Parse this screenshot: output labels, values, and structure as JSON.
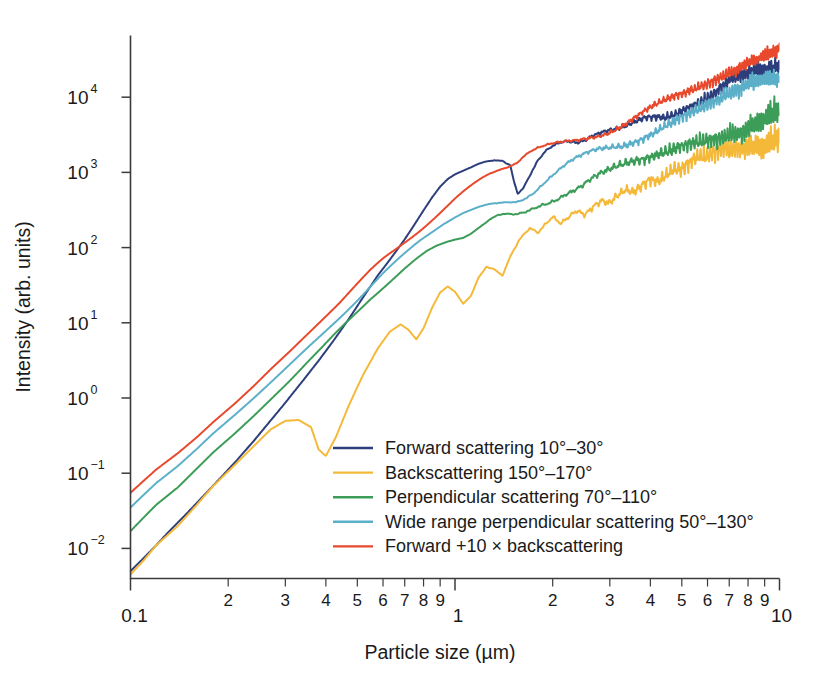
{
  "chart_data": {
    "type": "line",
    "title": "",
    "xlabel": "Particle size (µm)",
    "ylabel": "Intensity (arb. units)",
    "xscale": "log",
    "yscale": "log",
    "xlim": [
      0.1,
      10
    ],
    "ylim": [
      0.003,
      70000
    ],
    "grid": false,
    "legend_position": "inside-lower-right",
    "x_tick_labels_major": [
      "0.1",
      "1",
      "10"
    ],
    "x_tick_labels_minor": [
      "2",
      "3",
      "4",
      "5",
      "6",
      "7",
      "8",
      "9"
    ],
    "y_tick_labels": [
      "10⁻²",
      "10⁻¹",
      "10⁰",
      "10¹",
      "10²",
      "10³",
      "10⁴"
    ],
    "y_tick_bases": [
      "10",
      "10",
      "10",
      "10",
      "10",
      "10",
      "10"
    ],
    "y_tick_exponents": [
      "-2",
      "-1",
      "0",
      "1",
      "2",
      "3",
      "4"
    ],
    "y_tick_values": [
      0.01,
      0.1,
      1,
      10,
      100,
      1000,
      10000
    ],
    "series": [
      {
        "name": "Forward scattering 10°–30°",
        "color": "#2C3E7C",
        "legend_label": "Forward scattering 10°–30°",
        "x": [
          0.1,
          0.11,
          0.12,
          0.13,
          0.15,
          0.17,
          0.19,
          0.21,
          0.24,
          0.27,
          0.3,
          0.34,
          0.38,
          0.42,
          0.47,
          0.52,
          0.58,
          0.62,
          0.66,
          0.7,
          0.75,
          0.8,
          0.85,
          0.9,
          0.95,
          1.0,
          1.06,
          1.12,
          1.18,
          1.25,
          1.32,
          1.4,
          1.48,
          1.52,
          1.56,
          1.62,
          1.7,
          1.8,
          1.9,
          2.0,
          2.12,
          2.24,
          2.37,
          2.51,
          2.66,
          2.82,
          2.98,
          3.16,
          3.35,
          3.55,
          3.76,
          3.98,
          4.22,
          4.47,
          4.73,
          5.01,
          5.31,
          5.62,
          5.96,
          6.31,
          6.68,
          7.08,
          7.5,
          7.94,
          8.41,
          8.91,
          9.44,
          10.0
        ],
        "y": [
          0.005,
          0.0075,
          0.011,
          0.016,
          0.03,
          0.053,
          0.088,
          0.14,
          0.27,
          0.5,
          0.86,
          1.7,
          3.2,
          5.8,
          11.5,
          22,
          44,
          64,
          92,
          130,
          200,
          300,
          430,
          580,
          720,
          830,
          950,
          1100,
          1300,
          1500,
          1650,
          1700,
          1500,
          900,
          620,
          700,
          1000,
          1500,
          1900,
          2150,
          2350,
          2400,
          2300,
          2500,
          2900,
          3200,
          3400,
          3500,
          3800,
          4300,
          4900,
          5400,
          5700,
          6000,
          6800,
          7900,
          9000,
          9800,
          10500,
          11500,
          13500,
          15500,
          17000,
          18000,
          19500,
          21000,
          22500,
          24000
        ]
      },
      {
        "name": "Backscattering 150°–170°",
        "color": "#F5B93A",
        "legend_label": "Backscattering 150°–170°",
        "x": [
          0.1,
          0.11,
          0.12,
          0.14,
          0.16,
          0.18,
          0.21,
          0.24,
          0.27,
          0.3,
          0.33,
          0.36,
          0.38,
          0.4,
          0.43,
          0.47,
          0.52,
          0.58,
          0.63,
          0.68,
          0.72,
          0.76,
          0.8,
          0.85,
          0.9,
          0.95,
          1.0,
          1.06,
          1.12,
          1.18,
          1.25,
          1.32,
          1.4,
          1.48,
          1.58,
          1.7,
          1.8,
          1.9,
          2.0,
          2.12,
          2.24,
          2.37,
          2.51,
          2.66,
          2.82,
          2.98,
          3.16,
          3.35,
          3.55,
          3.76,
          3.98,
          4.22,
          4.47,
          4.73,
          5.01,
          5.31,
          5.62,
          5.96,
          6.31,
          6.68,
          7.08,
          7.5,
          7.94,
          8.41,
          8.91,
          9.44,
          10.0
        ],
        "y": [
          0.0045,
          0.007,
          0.011,
          0.02,
          0.038,
          0.068,
          0.13,
          0.23,
          0.38,
          0.5,
          0.52,
          0.42,
          0.21,
          0.17,
          0.3,
          0.75,
          1.9,
          4.5,
          7.5,
          9.5,
          8.0,
          6.0,
          8.5,
          16,
          26,
          32,
          28,
          20,
          26,
          45,
          62,
          55,
          42,
          70,
          110,
          150,
          130,
          175,
          230,
          200,
          260,
          330,
          300,
          380,
          460,
          420,
          520,
          620,
          580,
          700,
          850,
          800,
          950,
          1100,
          1050,
          1250,
          1400,
          1350,
          1600,
          1850,
          1800,
          2100,
          2400,
          2350,
          2700,
          3000,
          3300
        ]
      },
      {
        "name": "Perpendicular scattering 70°–110°",
        "color": "#3C9D58",
        "legend_label": "Perpendicular scattering 70°–110°",
        "x": [
          0.1,
          0.11,
          0.12,
          0.14,
          0.16,
          0.18,
          0.21,
          0.24,
          0.27,
          0.31,
          0.35,
          0.39,
          0.44,
          0.49,
          0.55,
          0.6,
          0.65,
          0.7,
          0.76,
          0.82,
          0.88,
          0.95,
          1.0,
          1.06,
          1.12,
          1.2,
          1.28,
          1.36,
          1.45,
          1.55,
          1.65,
          1.75,
          1.85,
          1.95,
          2.05,
          2.18,
          2.31,
          2.45,
          2.6,
          2.75,
          2.92,
          3.09,
          3.28,
          3.47,
          3.68,
          3.9,
          4.14,
          4.38,
          4.65,
          4.92,
          5.22,
          5.53,
          5.86,
          6.21,
          6.59,
          6.98,
          7.4,
          7.85,
          8.32,
          8.82,
          9.35,
          10.0
        ],
        "y": [
          0.017,
          0.026,
          0.038,
          0.065,
          0.115,
          0.19,
          0.34,
          0.58,
          0.95,
          1.7,
          2.9,
          4.6,
          8.0,
          13,
          22,
          31,
          42,
          55,
          72,
          90,
          105,
          118,
          125,
          130,
          145,
          175,
          210,
          240,
          250,
          260,
          300,
          360,
          420,
          470,
          520,
          600,
          650,
          700,
          800,
          880,
          950,
          1050,
          1150,
          1250,
          1350,
          1450,
          1600,
          1750,
          1900,
          2100,
          2300,
          2500,
          2750,
          3000,
          3300,
          3600,
          3900,
          4200,
          4600,
          5000,
          5400,
          6000
        ]
      },
      {
        "name": "Wide range perpendicular scattering 50°–130°",
        "color": "#5CAFC9",
        "legend_label": "Wide range perpendicular scattering 50°–130°",
        "x": [
          0.1,
          0.11,
          0.12,
          0.14,
          0.16,
          0.18,
          0.21,
          0.24,
          0.27,
          0.31,
          0.35,
          0.39,
          0.44,
          0.49,
          0.55,
          0.6,
          0.66,
          0.72,
          0.78,
          0.85,
          0.92,
          1.0,
          1.06,
          1.12,
          1.2,
          1.28,
          1.36,
          1.45,
          1.55,
          1.65,
          1.75,
          1.85,
          1.95,
          2.06,
          2.18,
          2.31,
          2.45,
          2.6,
          2.75,
          2.92,
          3.09,
          3.28,
          3.47,
          3.68,
          3.9,
          4.14,
          4.38,
          4.65,
          4.92,
          5.22,
          5.53,
          5.86,
          6.21,
          6.59,
          6.98,
          7.4,
          7.85,
          8.32,
          8.82,
          9.35,
          10.0
        ],
        "y": [
          0.035,
          0.052,
          0.074,
          0.125,
          0.21,
          0.34,
          0.6,
          1.0,
          1.6,
          2.8,
          4.6,
          7.2,
          12,
          19,
          31,
          44,
          62,
          85,
          115,
          155,
          205,
          260,
          300,
          330,
          370,
          400,
          420,
          440,
          450,
          500,
          580,
          700,
          820,
          950,
          1100,
          1250,
          1400,
          1600,
          1800,
          2000,
          2200,
          2400,
          2700,
          3000,
          3400,
          3800,
          4300,
          4800,
          5400,
          6000,
          6800,
          7600,
          8500,
          9500,
          10500,
          11500,
          12500,
          13500,
          14500,
          15500,
          16500
        ]
      },
      {
        "name": "Forward +10 × backscattering",
        "color": "#E8492C",
        "legend_label": "Forward +10 × backscattering",
        "x": [
          0.1,
          0.11,
          0.12,
          0.14,
          0.16,
          0.18,
          0.21,
          0.24,
          0.27,
          0.31,
          0.35,
          0.39,
          0.44,
          0.49,
          0.55,
          0.6,
          0.66,
          0.72,
          0.78,
          0.85,
          0.92,
          1.0,
          1.06,
          1.12,
          1.2,
          1.28,
          1.36,
          1.45,
          1.55,
          1.62,
          1.7,
          1.8,
          1.9,
          2.0,
          2.12,
          2.24,
          2.37,
          2.51,
          2.66,
          2.82,
          2.98,
          3.16,
          3.35,
          3.55,
          3.76,
          3.98,
          4.22,
          4.47,
          4.73,
          5.01,
          5.31,
          5.62,
          5.96,
          6.31,
          6.68,
          7.08,
          7.5,
          7.94,
          8.41,
          8.91,
          9.44,
          10.0
        ],
        "y": [
          0.055,
          0.08,
          0.112,
          0.185,
          0.3,
          0.48,
          0.85,
          1.45,
          2.4,
          4.2,
          7.0,
          11,
          18,
          29,
          48,
          68,
          96,
          135,
          185,
          260,
          350,
          470,
          560,
          650,
          780,
          900,
          1000,
          1100,
          1250,
          1500,
          1750,
          1950,
          2100,
          2250,
          2400,
          2600,
          2800,
          3100,
          3400,
          3700,
          4000,
          4400,
          4800,
          5300,
          5900,
          6500,
          7200,
          8000,
          9000,
          10000,
          11500,
          13000,
          15000,
          17000,
          19000,
          22000,
          25000,
          29000,
          33000,
          38000,
          44000,
          52000
        ]
      }
    ]
  },
  "axes": {
    "y_axis_title": "Intensity (arb. units)",
    "x_axis_title": "Particle size (µm)",
    "x_major_ticks": [
      {
        "label": "0.1",
        "value": 0.1
      },
      {
        "label": "1",
        "value": 1
      },
      {
        "label": "10",
        "value": 10
      }
    ],
    "x_minor_ticks": [
      {
        "label": "2",
        "value": 0.2
      },
      {
        "label": "3",
        "value": 0.3
      },
      {
        "label": "4",
        "value": 0.4
      },
      {
        "label": "5",
        "value": 0.5
      },
      {
        "label": "6",
        "value": 0.6
      },
      {
        "label": "7",
        "value": 0.7
      },
      {
        "label": "8",
        "value": 0.8
      },
      {
        "label": "9",
        "value": 0.9
      },
      {
        "label": "2",
        "value": 2
      },
      {
        "label": "3",
        "value": 3
      },
      {
        "label": "4",
        "value": 4
      },
      {
        "label": "5",
        "value": 5
      },
      {
        "label": "6",
        "value": 6
      },
      {
        "label": "7",
        "value": 7
      },
      {
        "label": "8",
        "value": 8
      },
      {
        "label": "9",
        "value": 9
      }
    ]
  },
  "legend": {
    "entries": [
      {
        "label": "Forward scattering 10°–30°",
        "color": "#2C3E7C"
      },
      {
        "label": "Backscattering 150°–170°",
        "color": "#F5B93A"
      },
      {
        "label": "Perpendicular scattering 70°–110°",
        "color": "#3C9D58"
      },
      {
        "label": "Wide range perpendicular scattering 50°–130°",
        "color": "#5CAFC9"
      },
      {
        "label": "Forward +10 × backscattering",
        "color": "#E8492C"
      }
    ]
  },
  "colors": {
    "axis": "#3b3b3b",
    "text": "#1a1a1a",
    "background": "#ffffff"
  }
}
